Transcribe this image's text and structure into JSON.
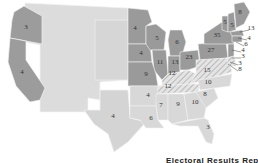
{
  "colors": {
    "north": "#9a9a9a",
    "west_free": "#a8a8a8",
    "territory": "#dcdcdc",
    "south": "#d8d8d8",
    "border_hatch": "#c8c8c8",
    "outline": "#f2f2f2",
    "background": "#ffffff"
  },
  "caption": "Electoral Results Repor",
  "states": [
    {
      "name": "Oregon",
      "votes": "3",
      "x": 26,
      "y": 29
    },
    {
      "name": "California",
      "votes": "4",
      "x": 22,
      "y": 74
    },
    {
      "name": "Texas",
      "votes": "4",
      "x": 113,
      "y": 118
    },
    {
      "name": "Minnesota",
      "votes": "4",
      "x": 135,
      "y": 30
    },
    {
      "name": "Iowa",
      "votes": "4",
      "x": 141,
      "y": 55
    },
    {
      "name": "Wisconsin",
      "votes": "5",
      "x": 157,
      "y": 40
    },
    {
      "name": "Michigan",
      "votes": "6",
      "x": 177,
      "y": 44
    },
    {
      "name": "Illinois",
      "votes": "11",
      "x": 160,
      "y": 64
    },
    {
      "name": "Indiana",
      "votes": "13",
      "x": 175,
      "y": 64
    },
    {
      "name": "Ohio",
      "votes": "23",
      "x": 189,
      "y": 59
    },
    {
      "name": "Pennsylvania",
      "votes": "27",
      "x": 211,
      "y": 52
    },
    {
      "name": "New York",
      "votes": "35",
      "x": 217,
      "y": 37
    },
    {
      "name": "Vermont",
      "votes": "5",
      "x": 225,
      "y": 24
    },
    {
      "name": "New Hampshire",
      "votes": "5",
      "x": 232,
      "y": 27
    },
    {
      "name": "Maine",
      "votes": "8",
      "x": 240,
      "y": 14
    },
    {
      "name": "Massachusetts",
      "votes": "13",
      "x": 251,
      "y": 30
    },
    {
      "name": "Rhode Island",
      "votes": "4",
      "x": 249,
      "y": 40
    },
    {
      "name": "Connecticut",
      "votes": "6",
      "x": 246,
      "y": 46
    },
    {
      "name": "New Jersey",
      "votes": "4",
      "x": 243,
      "y": 52
    },
    {
      "name": "Delaware",
      "votes": "3",
      "x": 243,
      "y": 58
    },
    {
      "name": "Maryland",
      "votes": "3",
      "x": 240,
      "y": 65
    },
    {
      "name": "Virginia (DC area)",
      "votes": "8",
      "x": 240,
      "y": 71
    },
    {
      "name": "Missouri",
      "votes": "9",
      "x": 146,
      "y": 76
    },
    {
      "name": "Kentucky",
      "votes": "12",
      "x": 172,
      "y": 75
    },
    {
      "name": "Virginia",
      "votes": "15",
      "x": 207,
      "y": 72
    },
    {
      "name": "Tennessee",
      "votes": "12",
      "x": 168,
      "y": 88
    },
    {
      "name": "North Carolina",
      "votes": "10",
      "x": 208,
      "y": 84
    },
    {
      "name": "Arkansas",
      "votes": "4",
      "x": 148,
      "y": 97
    },
    {
      "name": "South Carolina",
      "votes": "8",
      "x": 205,
      "y": 96
    },
    {
      "name": "Mississippi",
      "votes": "7",
      "x": 161,
      "y": 107
    },
    {
      "name": "Alabama",
      "votes": "9",
      "x": 178,
      "y": 106
    },
    {
      "name": "Georgia",
      "votes": "10",
      "x": 195,
      "y": 104
    },
    {
      "name": "Louisiana",
      "votes": "6",
      "x": 151,
      "y": 120
    },
    {
      "name": "Florida",
      "votes": "3",
      "x": 208,
      "y": 129
    }
  ]
}
